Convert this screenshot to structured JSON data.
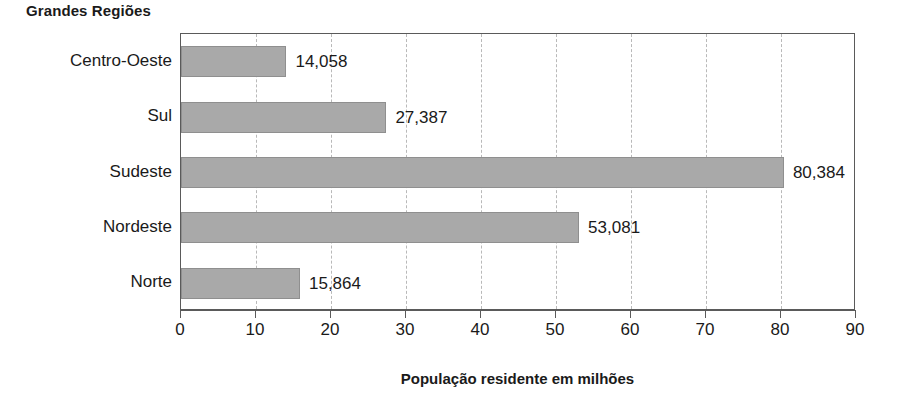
{
  "chart_data": {
    "type": "bar",
    "orientation": "horizontal",
    "title": "Grandes Regiões",
    "xlabel": "População residente em milhões",
    "ylabel": "",
    "categories": [
      "Centro-Oeste",
      "Sul",
      "Sudeste",
      "Nordeste",
      "Norte"
    ],
    "values": [
      14.058,
      27.387,
      80.384,
      53.081,
      15.864
    ],
    "value_labels": [
      "14,058",
      "27,387",
      "80,384",
      "53,081",
      "15,864"
    ],
    "xlim": [
      0,
      90
    ],
    "xticks": [
      0,
      10,
      20,
      30,
      40,
      50,
      60,
      70,
      80,
      90
    ],
    "xtick_labels": [
      "0",
      "10",
      "20",
      "30",
      "40",
      "50",
      "60",
      "70",
      "80",
      "90"
    ],
    "grid": "vertical-dashed",
    "legend": "none",
    "colors": {
      "bar_fill": "#a9a9a9",
      "bar_border": "#8f8f8f",
      "gridline": "#b9b9b9",
      "axis": "#5a5a5a",
      "text": "#1a1a1a",
      "background": "#ffffff"
    }
  }
}
